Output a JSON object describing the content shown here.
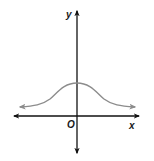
{
  "diagram": {
    "type": "function-graph",
    "axes": {
      "x_label": "x",
      "y_label": "y",
      "origin_label": "O"
    },
    "curve": {
      "shape": "bell",
      "color": "#8c8c8c",
      "end_arrows": true
    },
    "colors": {
      "axes": "#111111",
      "curve": "#8c8c8c",
      "labels": "#1a1a1a"
    }
  }
}
